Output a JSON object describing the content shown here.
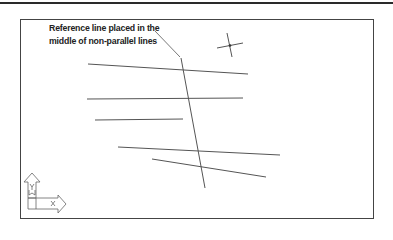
{
  "annotation": {
    "line1": "Reference line placed in the",
    "line2": "middle of non-parallel lines"
  },
  "colors": {
    "stroke": "#555555",
    "frame": "#444444",
    "topbar": "#2a2a2a",
    "background": "#ffffff"
  },
  "ucs_icon": {
    "x_label": "X",
    "y_label": "Y",
    "w_label": "W"
  },
  "drawing": {
    "frame": {
      "x1": 20,
      "y1": 19,
      "x2": 373,
      "y2": 218
    },
    "non_parallel_lines": [
      {
        "x1": 88,
        "y1": 64,
        "x2": 248,
        "y2": 74
      },
      {
        "x1": 87,
        "y1": 99,
        "x2": 243,
        "y2": 98
      },
      {
        "x1": 95,
        "y1": 120,
        "x2": 183,
        "y2": 119
      },
      {
        "x1": 118,
        "y1": 147,
        "x2": 280,
        "y2": 155
      },
      {
        "x1": 152,
        "y1": 159,
        "x2": 266,
        "y2": 177
      }
    ],
    "reference_line": {
      "x1": 181,
      "y1": 58,
      "x2": 205,
      "y2": 188
    },
    "leader": {
      "x1": 155,
      "y1": 31,
      "x2": 181,
      "y2": 58
    },
    "crosshair": {
      "cx": 230,
      "cy": 45
    }
  }
}
